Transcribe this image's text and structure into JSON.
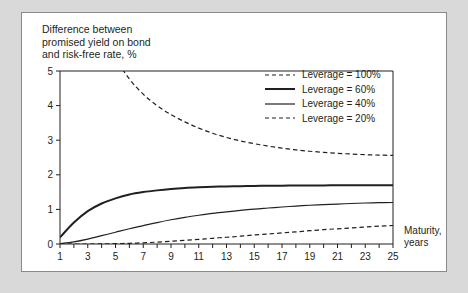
{
  "figure": {
    "title": "Difference between\npromised yield on bond\nand risk-free rate, %",
    "x_axis_label": "Maturity,\nyears",
    "background_color": "#d9d9d9",
    "panel_color": "#ffffff",
    "line_color": "#231f20"
  },
  "legend": {
    "position": "top-right-inside",
    "items": [
      {
        "label": "Leverage = 100%",
        "style": "dashed",
        "width": 1.2
      },
      {
        "label": "Leverage = 60%",
        "style": "solid",
        "width": 2.0
      },
      {
        "label": "Leverage = 40%",
        "style": "solid",
        "width": 1.2
      },
      {
        "label": "Leverage = 20%",
        "style": "dashed",
        "width": 1.2
      }
    ]
  },
  "chart_data": {
    "type": "line",
    "title": "Difference between promised yield on bond and risk-free rate, %",
    "xlabel": "Maturity, years",
    "ylabel": "Difference between promised yield on bond and risk-free rate, %",
    "xlim": [
      1,
      25
    ],
    "ylim": [
      0,
      5
    ],
    "xticks": [
      1,
      2,
      3,
      4,
      5,
      6,
      7,
      8,
      9,
      10,
      11,
      12,
      13,
      14,
      15,
      16,
      17,
      18,
      19,
      20,
      21,
      22,
      23,
      24,
      25
    ],
    "xticklabels": [
      "1",
      "",
      "3",
      "",
      "5",
      "",
      "7",
      "",
      "9",
      "",
      "11",
      "",
      "13",
      "",
      "15",
      "",
      "17",
      "",
      "19",
      "",
      "21",
      "",
      "23",
      "",
      "25"
    ],
    "yticks": [
      0,
      1,
      2,
      3,
      4,
      5
    ],
    "yticklabels": [
      "0",
      "1",
      "2",
      "3",
      "4",
      "5"
    ],
    "grid": false,
    "x": [
      1,
      2,
      3,
      4,
      5,
      6,
      7,
      8,
      9,
      10,
      11,
      12,
      13,
      14,
      15,
      16,
      17,
      18,
      19,
      20,
      21,
      22,
      23,
      24,
      25
    ],
    "series": [
      {
        "name": "Leverage = 100%",
        "style": "dashed",
        "width": 1.2,
        "values": [
          13.9,
          9.7,
          7.6,
          6.3,
          5.4,
          4.77,
          4.33,
          4.0,
          3.74,
          3.53,
          3.35,
          3.2,
          3.08,
          2.98,
          2.9,
          2.83,
          2.77,
          2.72,
          2.68,
          2.65,
          2.62,
          2.6,
          2.58,
          2.57,
          2.56
        ]
      },
      {
        "name": "Leverage = 60%",
        "style": "solid",
        "width": 2.0,
        "values": [
          0.19,
          0.62,
          0.95,
          1.17,
          1.32,
          1.43,
          1.5,
          1.55,
          1.59,
          1.62,
          1.64,
          1.655,
          1.665,
          1.672,
          1.678,
          1.682,
          1.686,
          1.689,
          1.692,
          1.694,
          1.696,
          1.698,
          1.699,
          1.7,
          1.7
        ]
      },
      {
        "name": "Leverage = 40%",
        "style": "solid",
        "width": 1.2,
        "values": [
          0.01,
          0.06,
          0.14,
          0.24,
          0.34,
          0.44,
          0.53,
          0.62,
          0.7,
          0.77,
          0.83,
          0.885,
          0.93,
          0.97,
          1.01,
          1.04,
          1.07,
          1.095,
          1.12,
          1.14,
          1.155,
          1.17,
          1.185,
          1.195,
          1.2
        ]
      },
      {
        "name": "Leverage = 20%",
        "style": "dashed",
        "width": 1.2,
        "values": [
          0.0,
          0.0,
          0.0,
          0.005,
          0.01,
          0.02,
          0.035,
          0.055,
          0.08,
          0.105,
          0.135,
          0.165,
          0.195,
          0.225,
          0.26,
          0.29,
          0.32,
          0.35,
          0.385,
          0.415,
          0.44,
          0.465,
          0.49,
          0.515,
          0.535
        ]
      }
    ]
  }
}
